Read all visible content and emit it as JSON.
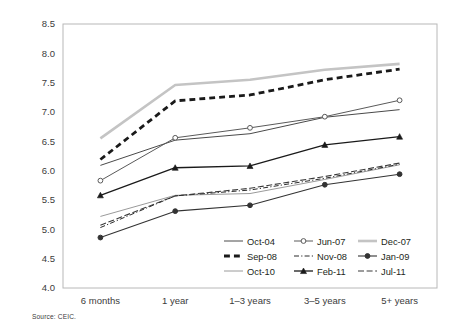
{
  "source_note": "Source: CEIC.",
  "chart_data": {
    "type": "line",
    "title": "",
    "subtitle": "",
    "xlabel": "",
    "ylabel": "",
    "categories": [
      "6 months",
      "1 year",
      "1–3 years",
      "3–5 years",
      "5+ years"
    ],
    "ylim": [
      4.0,
      8.5
    ],
    "yticks": [
      "4.0",
      "4.5",
      "5.0",
      "5.5",
      "6.0",
      "6.5",
      "7.0",
      "7.5",
      "8.0",
      "8.5"
    ],
    "ytick_values": [
      4.0,
      4.5,
      5.0,
      5.5,
      6.0,
      6.5,
      7.0,
      7.5,
      8.0,
      8.5
    ],
    "grid": false,
    "legend_position": "inside-bottom-right",
    "legend_columns": 3,
    "series": [
      {
        "name": "Oct-04",
        "values": [
          6.09,
          6.52,
          6.63,
          6.91,
          7.04
        ],
        "color": "#4a4a4a",
        "width": 1.0,
        "dash": "none",
        "marker": "none"
      },
      {
        "name": "Jun-07",
        "values": [
          5.83,
          6.56,
          6.73,
          6.92,
          7.2
        ],
        "color": "#5a5a5a",
        "width": 1.0,
        "dash": "none",
        "marker": "circle-open"
      },
      {
        "name": "Dec-07",
        "values": [
          6.55,
          7.46,
          7.55,
          7.72,
          7.82
        ],
        "color": "#c4c4c4",
        "width": 2.6,
        "dash": "none",
        "marker": "none"
      },
      {
        "name": "Sep-08",
        "values": [
          6.19,
          7.19,
          7.29,
          7.55,
          7.73
        ],
        "color": "#1a1a1a",
        "width": 2.8,
        "dash": "dashed",
        "marker": "none"
      },
      {
        "name": "Nov-08",
        "values": [
          5.03,
          5.57,
          5.67,
          5.87,
          6.11
        ],
        "color": "#2b2b2b",
        "width": 1.0,
        "dash": "dashdot",
        "marker": "none"
      },
      {
        "name": "Jan-09",
        "values": [
          4.86,
          5.31,
          5.41,
          5.76,
          5.94
        ],
        "color": "#333333",
        "width": 1.1,
        "dash": "none",
        "marker": "circle-filled"
      },
      {
        "name": "Oct-10",
        "values": [
          5.22,
          5.58,
          5.61,
          5.85,
          6.1
        ],
        "color": "#9a9a9a",
        "width": 1.0,
        "dash": "none",
        "marker": "none"
      },
      {
        "name": "Feb-11",
        "values": [
          5.58,
          6.05,
          6.08,
          6.44,
          6.58
        ],
        "color": "#1a1a1a",
        "width": 1.3,
        "dash": "none",
        "marker": "triangle-filled"
      },
      {
        "name": "Jul-11",
        "values": [
          5.07,
          5.57,
          5.7,
          5.9,
          6.13
        ],
        "color": "#3a3a3a",
        "width": 1.1,
        "dash": "longdash",
        "marker": "none"
      }
    ]
  }
}
